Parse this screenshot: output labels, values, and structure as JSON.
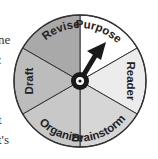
{
  "page_fragments": [
    {
      "text": "ne",
      "top": 32
    },
    {
      "text": ":",
      "top": 52
    },
    {
      "text": "t",
      "top": 112
    },
    {
      "text": "t's",
      "top": 132
    }
  ],
  "wheel": {
    "title": "Writing process wheel",
    "segments": [
      {
        "label": "Purpose",
        "color": "#ffffff"
      },
      {
        "label": "Reader",
        "color": "#ececec"
      },
      {
        "label": "Brainstorm",
        "color": "#d6d6d6"
      },
      {
        "label": "Organize",
        "color": "#c8c8c8"
      },
      {
        "label": "Draft",
        "color": "#bcbcbc"
      },
      {
        "label": "Revise",
        "color": "#a9a9a9"
      }
    ],
    "pointer": {
      "points_to": "Purpose",
      "color": "#1a1a1a"
    },
    "outline_color": "#333333"
  }
}
